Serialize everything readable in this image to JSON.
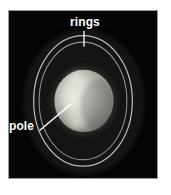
{
  "figure": {
    "background_color": "#ffffff",
    "sky_color": "#050505",
    "frame_border_color": "#9a9a9a",
    "label_color": "#ffffff",
    "annotations": [
      {
        "id": "rings",
        "label": "rings",
        "icon": "tick-mark-icon",
        "leader": "vertical-tick",
        "position": "top-center"
      },
      {
        "id": "pole",
        "label": "pole",
        "icon": "leader-line-icon",
        "leader": "diagonal-line",
        "position": "left-middle"
      }
    ],
    "features": {
      "planet": {
        "name": "planet-disk",
        "center_x": 84,
        "center_y": 101,
        "radius_x": 29,
        "radius_y": 31,
        "bright_color": "#d8d8d0",
        "mid_color": "#9a9a94",
        "dark_color": "#6a6a66"
      },
      "rings": {
        "name": "ring-ellipse",
        "center_x": 83,
        "center_y": 101,
        "outer_rx": 50,
        "outer_ry": 66,
        "inner_rx": 45,
        "inner_ry": 60,
        "color": "#c4c4c0"
      },
      "pole_spot": {
        "name": "bright-pole-region",
        "center_x": 73,
        "center_y": 98,
        "color": "#e2e2dc"
      }
    }
  }
}
